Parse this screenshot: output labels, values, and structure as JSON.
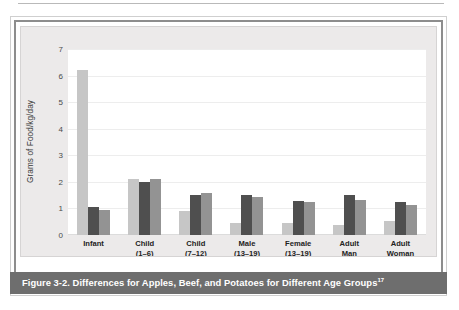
{
  "figure": {
    "caption": "Figure 3-2. Differences for Apples, Beef, and Potatoes for Different Age Groups",
    "caption_footnote_marker": "17",
    "caption_bar_color": "#6e6e6e",
    "panel_color": "#eceaea",
    "plot_color": "#ffffff"
  },
  "legend": {
    "position": "top-right",
    "items": [
      {
        "label": "Apples",
        "color": "#c6c6c6"
      },
      {
        "label": "Beef",
        "color": "#4f4f4f"
      },
      {
        "label": "Potatoes",
        "color": "#939393"
      }
    ]
  },
  "axes": {
    "ylabel": "Grams of Food/kg/day",
    "xlabel": "",
    "yticks": [
      "0",
      "1",
      "2",
      "3",
      "4",
      "5",
      "6",
      "7"
    ],
    "ylim": [
      0,
      7
    ],
    "grid": true
  },
  "categories": [
    {
      "line1": "Infant",
      "line2": ""
    },
    {
      "line1": "Child",
      "line2": "(1–6)"
    },
    {
      "line1": "Child",
      "line2": "(7–12)"
    },
    {
      "line1": "Male",
      "line2": "(13–19)"
    },
    {
      "line1": "Female",
      "line2": "(13–19)"
    },
    {
      "line1": "Adult",
      "line2": "Man"
    },
    {
      "line1": "Adult",
      "line2": "Woman"
    }
  ],
  "chart_data": {
    "type": "bar",
    "title": "Figure 3-2. Differences for Apples, Beef, and Potatoes for Different Age Groups",
    "xlabel": "",
    "ylabel": "Grams of Food/kg/day",
    "ylim": [
      0,
      7
    ],
    "ytick_values": [
      0,
      1,
      2,
      3,
      4,
      5,
      6,
      7
    ],
    "grid": true,
    "legend_position": "top-right",
    "categories": [
      "Infant",
      "Child (1–6)",
      "Child (7–12)",
      "Male (13–19)",
      "Female (13–19)",
      "Adult Man",
      "Adult Woman"
    ],
    "series": [
      {
        "name": "Apples",
        "color": "#c6c6c6",
        "values": [
          6.2,
          2.12,
          0.9,
          0.47,
          0.47,
          0.37,
          0.52
        ]
      },
      {
        "name": "Beef",
        "color": "#4f4f4f",
        "values": [
          1.05,
          2.0,
          1.5,
          1.5,
          1.27,
          1.5,
          1.23
        ]
      },
      {
        "name": "Potatoes",
        "color": "#939393",
        "values": [
          0.93,
          2.1,
          1.6,
          1.42,
          1.26,
          1.3,
          1.12
        ]
      }
    ]
  }
}
